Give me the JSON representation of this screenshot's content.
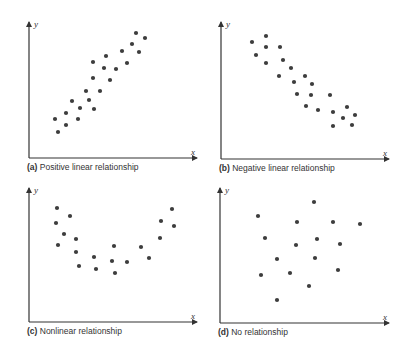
{
  "figure": {
    "colors": {
      "axis": "#333333",
      "point": "#3d3d3d",
      "background": "#ffffff"
    }
  },
  "chart_data": [
    {
      "id": "a",
      "type": "scatter",
      "panel_label": "(a)",
      "title": "Positive linear relationship",
      "xlabel": "x",
      "ylabel": "y",
      "grid": false,
      "axes_origin_px": [
        29,
        158
      ],
      "axes_end_px": [
        197,
        22
      ],
      "points_px": [
        [
          55,
          119
        ],
        [
          58,
          132
        ],
        [
          66,
          113
        ],
        [
          66,
          125
        ],
        [
          72,
          101
        ],
        [
          78,
          119
        ],
        [
          80,
          108
        ],
        [
          86,
          91
        ],
        [
          89,
          100
        ],
        [
          94,
          109
        ],
        [
          93,
          62
        ],
        [
          93,
          78
        ],
        [
          100,
          91
        ],
        [
          104,
          68
        ],
        [
          106,
          56
        ],
        [
          110,
          80
        ],
        [
          116,
          69
        ],
        [
          122,
          51
        ],
        [
          127,
          63
        ],
        [
          132,
          44
        ],
        [
          136,
          33
        ],
        [
          139,
          52
        ],
        [
          145,
          38
        ]
      ]
    },
    {
      "id": "b",
      "type": "scatter",
      "panel_label": "(b)",
      "title": "Negative linear relationship",
      "xlabel": "x",
      "ylabel": "y",
      "grid": false,
      "axes_origin_px": [
        221,
        159
      ],
      "axes_end_px": [
        389,
        22
      ],
      "points_px": [
        [
          252,
          42
        ],
        [
          266,
          36
        ],
        [
          256,
          55
        ],
        [
          266,
          47
        ],
        [
          266,
          63
        ],
        [
          280,
          47
        ],
        [
          283,
          60
        ],
        [
          279,
          76
        ],
        [
          291,
          68
        ],
        [
          294,
          82
        ],
        [
          297,
          94
        ],
        [
          305,
          76
        ],
        [
          312,
          84
        ],
        [
          311,
          95
        ],
        [
          306,
          106
        ],
        [
          318,
          110
        ],
        [
          330,
          95
        ],
        [
          333,
          112
        ],
        [
          333,
          126
        ],
        [
          347,
          107
        ],
        [
          343,
          118
        ],
        [
          355,
          115
        ],
        [
          352,
          125
        ]
      ]
    },
    {
      "id": "c",
      "type": "scatter",
      "panel_label": "(c)",
      "title": "Nonlinear relationship",
      "xlabel": "x",
      "ylabel": "y",
      "grid": false,
      "axes_origin_px": [
        29,
        322
      ],
      "axes_end_px": [
        197,
        188
      ],
      "points_px": [
        [
          57,
          208
        ],
        [
          56,
          223
        ],
        [
          58,
          245
        ],
        [
          70,
          216
        ],
        [
          64,
          234
        ],
        [
          76,
          239
        ],
        [
          76,
          252
        ],
        [
          79,
          266
        ],
        [
          94,
          257
        ],
        [
          96,
          269
        ],
        [
          112,
          261
        ],
        [
          114,
          246
        ],
        [
          115,
          273
        ],
        [
          127,
          262
        ],
        [
          141,
          247
        ],
        [
          149,
          258
        ],
        [
          160,
          238
        ],
        [
          161,
          221
        ],
        [
          172,
          209
        ],
        [
          174,
          226
        ]
      ]
    },
    {
      "id": "d",
      "type": "scatter",
      "panel_label": "(d)",
      "title": "No relationship",
      "xlabel": "x",
      "ylabel": "y",
      "grid": false,
      "axes_origin_px": [
        220,
        323
      ],
      "axes_end_px": [
        389,
        188
      ],
      "points_px": [
        [
          258,
          216
        ],
        [
          314,
          202
        ],
        [
          297,
          222
        ],
        [
          333,
          222
        ],
        [
          360,
          224
        ],
        [
          265,
          238
        ],
        [
          296,
          245
        ],
        [
          317,
          239
        ],
        [
          340,
          244
        ],
        [
          277,
          259
        ],
        [
          315,
          258
        ],
        [
          261,
          275
        ],
        [
          290,
          273
        ],
        [
          338,
          270
        ],
        [
          309,
          286
        ],
        [
          277,
          300
        ]
      ]
    }
  ]
}
